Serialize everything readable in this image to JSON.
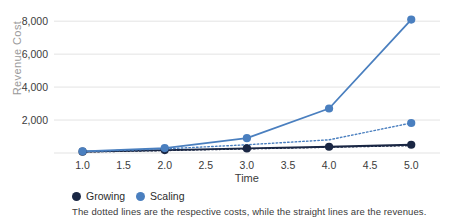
{
  "chart_data": {
    "type": "line",
    "title": "",
    "xlabel": "Time",
    "ylabel": "Revenue Cost",
    "x": [
      1.0,
      2.0,
      3.0,
      4.0,
      5.0
    ],
    "xticks": [
      "1.0",
      "1.5",
      "2.0",
      "2.5",
      "3.0",
      "3.5",
      "4.0",
      "4.5",
      "5.0"
    ],
    "xtick_values": [
      1.0,
      1.5,
      2.0,
      2.5,
      3.0,
      3.5,
      4.0,
      4.5,
      5.0
    ],
    "yticks": [
      "2,000",
      "4,000",
      "6,000",
      "8,000"
    ],
    "ytick_values": [
      2000,
      4000,
      6000,
      8000
    ],
    "xlim": [
      0.75,
      5.35
    ],
    "ylim": [
      0,
      8800
    ],
    "grid": "horizontal",
    "legend_position": "below-left",
    "series": [
      {
        "name": "Growing",
        "role": "revenue",
        "style": "solid",
        "color": "#1a2744",
        "values": [
          80,
          180,
          280,
          380,
          500
        ]
      },
      {
        "name": "Growing",
        "role": "cost",
        "style": "dotted",
        "color": "#1a2744",
        "values": [
          60,
          150,
          250,
          350,
          450
        ]
      },
      {
        "name": "Scaling",
        "role": "revenue",
        "style": "solid",
        "color": "#4a7fbf",
        "values": [
          100,
          300,
          900,
          2700,
          8100
        ]
      },
      {
        "name": "Scaling",
        "role": "cost",
        "style": "dotted",
        "color": "#4a7fbf",
        "values": [
          80,
          250,
          500,
          800,
          1820
        ]
      }
    ],
    "legend": [
      {
        "label": "Growing",
        "color": "#1a2744"
      },
      {
        "label": "Scaling",
        "color": "#4a7fbf"
      }
    ],
    "annotation": "The dotted lines are the respective costs, while the straight lines are the revenues.",
    "colors": {
      "growing": "#1a2744",
      "scaling": "#4a7fbf",
      "grid": "#e3e3e3",
      "axis_text": "#3b3b3b",
      "ylabel_text": "#9a9a9a"
    }
  }
}
